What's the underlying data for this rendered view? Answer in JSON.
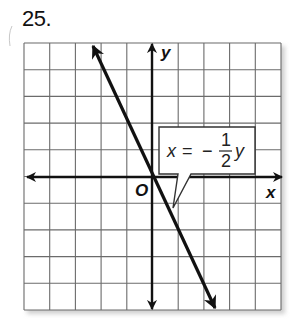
{
  "problem": {
    "number": "25."
  },
  "graph": {
    "grid": {
      "cols": 10,
      "rows": 10,
      "left": 24,
      "top": 43,
      "right": 281,
      "bottom": 310,
      "line_color": "#6b6b6b"
    },
    "axes": {
      "x_label": "x",
      "y_label": "y",
      "origin_label": "O",
      "origin_px": {
        "x": 152,
        "y": 177
      },
      "color": "#111111"
    },
    "line": {
      "equation": "x = -1/2 y",
      "from_px": {
        "x": 92,
        "y": 44
      },
      "to_px": {
        "x": 216,
        "y": 310
      },
      "color": "#111111"
    },
    "callout": {
      "lhs": "x",
      "equals": "=",
      "sign": "−",
      "numerator": "1",
      "denominator": "2",
      "variable": "y"
    }
  }
}
